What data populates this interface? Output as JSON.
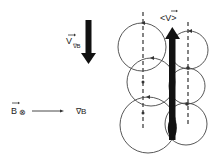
{
  "diagram": {
    "drift_velocity": {
      "label_main": "V",
      "label_sub": "∇B",
      "direction": "down"
    },
    "field": {
      "label": "B",
      "symbol": "⊗",
      "meaning": "into page"
    },
    "gradient": {
      "label": "∇B",
      "direction": "right"
    },
    "mean_velocity": {
      "label": "<V>",
      "direction": "up"
    },
    "orbits": {
      "left_column_count": 3,
      "right_column_count": 3
    },
    "colors": {
      "stroke": "#333333",
      "arrow_fill": "#111111",
      "background": "#ffffff"
    }
  }
}
